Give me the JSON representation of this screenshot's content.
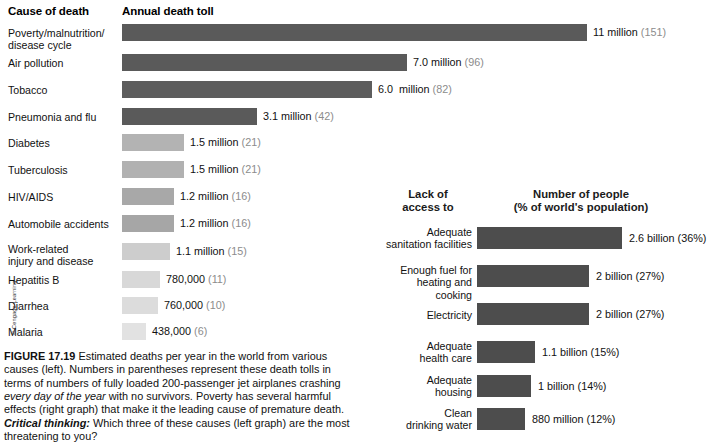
{
  "figure": {
    "number": "FIGURE 17.19",
    "caption_body": " Estimated deaths per year in the world from various causes (left). Numbers in parentheses represent these death tolls in terms of numbers of fully loaded 200-passenger jet airplanes crashing ",
    "caption_italic": "every day of the year",
    "caption_body2": " with no survivors. Poverty has several harmful effects (right graph) that make it the leading cause of premature death. ",
    "critical_label": "Critical thinking:",
    "critical_question": " Which three of these causes (left graph) are the most threatening to you?",
    "credit": "© Cengage Learning"
  },
  "left_chart": {
    "header_cause": "Cause of death",
    "header_toll": "Annual death toll"
  },
  "right_chart": {
    "header_access_line1": "Lack of",
    "header_access_line2": "access to",
    "header_people_line1": "Number of people",
    "header_people_line2": "(% of world's population)"
  },
  "chart_data": [
    {
      "type": "bar",
      "orientation": "horizontal",
      "title": "Annual death toll",
      "xlabel": "Cause of death",
      "ylabel": "Annual death toll",
      "categories": [
        "Poverty/malnutrition/\ndisease cycle",
        "Air pollution",
        "Tobacco",
        "Pneumonia and flu",
        "Diabetes",
        "Tuberculosis",
        "HIV/AIDS",
        "Automobile accidents",
        "Work-related\ninjury and disease",
        "Hepatitis B",
        "Diarrhea",
        "Malaria"
      ],
      "values": [
        11000000,
        7000000,
        6000000,
        3100000,
        1500000,
        1500000,
        1200000,
        1200000,
        1100000,
        780000,
        760000,
        438000
      ],
      "value_labels": [
        "11 million",
        "7.0 million",
        "6.0  million",
        "3.1 million",
        "1.5 million",
        "1.5 million",
        "1.2 million",
        "1.2 million",
        "1.1 million",
        "780,000",
        "760,000",
        "438,000"
      ],
      "paren_labels": [
        "(151)",
        "(96)",
        "(82)",
        "(42)",
        "(21)",
        "(21)",
        "(16)",
        "(16)",
        "(15)",
        "(11)",
        "(10)",
        "(6)"
      ],
      "bar_colors": [
        "#5a5a5a",
        "#5a5a5a",
        "#5d5d5d",
        "#5a5a5a",
        "#b3b3b3",
        "#b1b1b1",
        "#a8a8a8",
        "#a6a6a6",
        "#cdcdcd",
        "#d8d8d8",
        "#dcdcdc",
        "#e2e2e2"
      ],
      "bar_widths": [
        465,
        285,
        250,
        135,
        62,
        62,
        52,
        52,
        48,
        38,
        36,
        24
      ],
      "grid": false,
      "legend": "none"
    },
    {
      "type": "bar",
      "orientation": "horizontal",
      "title": "Number of people (% of world's population)",
      "xlabel": "Lack of access to",
      "ylabel": "Number of people",
      "categories": [
        "Adequate\nsanitation facilities",
        "Enough fuel for\nheating and cooking",
        "Electricity",
        "Adequate\nhealth care",
        "Adequate\nhousing",
        "Clean\ndrinking water"
      ],
      "values": [
        2600000000,
        2000000000,
        2000000000,
        1100000000,
        1000000000,
        880000000
      ],
      "value_labels": [
        "2.6 billion (36%)",
        "2 billion (27%)",
        "2 billion (27%)",
        "1.1 billion (15%)",
        "1 billion (14%)",
        "880 million (12%)"
      ],
      "percents": [
        36,
        27,
        27,
        15,
        14,
        12
      ],
      "bar_colors": [
        "#4d4d4d",
        "#4d4d4d",
        "#4d4d4d",
        "#4d4d4d",
        "#4d4d4d",
        "#4d4d4d"
      ],
      "bar_widths": [
        145,
        112,
        112,
        58,
        54,
        48
      ],
      "grid": false,
      "legend": "none"
    }
  ]
}
